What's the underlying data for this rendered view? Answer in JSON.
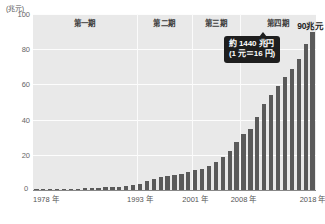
{
  "chart_data": {
    "type": "bar",
    "title": "",
    "subtitle": "",
    "unit_caption": "(兆元)",
    "xlabel": "",
    "ylabel": "",
    "ylim": [
      0,
      100
    ],
    "yticks": [
      0,
      20,
      40,
      60,
      80,
      100
    ],
    "ytick_labels": [
      "0",
      "20",
      "40",
      "60",
      "80",
      "100"
    ],
    "grid": true,
    "legend": "none",
    "bar_color": "#5a5a5a",
    "plot_background": "#e9e9e9",
    "gridline_color": "#fdfdfd",
    "xtick_labels": [
      "1978 年",
      "1993 年",
      "2001 年",
      "2008 年",
      "2018 年"
    ],
    "xtick_years": [
      1978,
      1993,
      2001,
      2008,
      2018
    ],
    "categories": [
      "1978",
      "1979",
      "1980",
      "1981",
      "1982",
      "1983",
      "1984",
      "1985",
      "1986",
      "1987",
      "1988",
      "1989",
      "1990",
      "1991",
      "1992",
      "1993",
      "1994",
      "1995",
      "1996",
      "1997",
      "1998",
      "1999",
      "2000",
      "2001",
      "2002",
      "2003",
      "2004",
      "2005",
      "2006",
      "2007",
      "2008",
      "2009",
      "2010",
      "2011",
      "2012",
      "2013",
      "2014",
      "2015",
      "2016",
      "2017",
      "2018"
    ],
    "values": [
      0.37,
      0.41,
      0.46,
      0.49,
      0.54,
      0.6,
      0.72,
      0.91,
      1.04,
      1.21,
      1.52,
      1.72,
      1.89,
      2.19,
      2.72,
      3.57,
      4.88,
      6.13,
      7.2,
      7.98,
      8.52,
      9.06,
      10.03,
      11.09,
      12.17,
      13.74,
      16.18,
      18.73,
      21.94,
      27.09,
      31.92,
      34.85,
      41.21,
      48.79,
      53.86,
      59.3,
      64.4,
      68.89,
      74.64,
      83.2,
      90.03
    ],
    "annotations": [
      {
        "name": "peak-value",
        "text": "90兆元",
        "attached_to_category": "2018"
      },
      {
        "name": "conversion-callout",
        "line1": "約 1440 兆円",
        "line2": "(1 元＝16 円)"
      }
    ],
    "period_bands": [
      {
        "label": "第一期",
        "start": "1978",
        "end": "1992"
      },
      {
        "label": "第二期",
        "start": "1993",
        "end": "2000"
      },
      {
        "label": "第三期",
        "start": "2001",
        "end": "2007"
      },
      {
        "label": "第四期",
        "start": "2008",
        "end": "2018"
      }
    ]
  }
}
